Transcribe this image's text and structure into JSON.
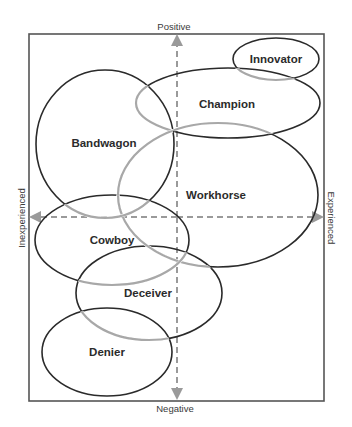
{
  "diagram": {
    "axes": {
      "top_label": "Positive",
      "bottom_label": "Negative",
      "left_label": "Inexperienced",
      "right_label": "Experienced"
    },
    "regions": [
      {
        "id": "innovator",
        "label": "Innovator",
        "cx": 276,
        "cy": 59,
        "rx": 43,
        "ry": 21
      },
      {
        "id": "champion",
        "label": "Champion",
        "cx": 228,
        "cy": 103,
        "rx": 92,
        "ry": 35
      },
      {
        "id": "bandwagon",
        "label": "Bandwagon",
        "cx": 105,
        "cy": 144,
        "rx": 69,
        "ry": 74
      },
      {
        "id": "workhorse",
        "label": "Workhorse",
        "cx": 218,
        "cy": 195,
        "rx": 100,
        "ry": 72
      },
      {
        "id": "cowboy",
        "label": "Cowboy",
        "cx": 112,
        "cy": 240,
        "rx": 77,
        "ry": 45
      },
      {
        "id": "deceiver",
        "label": "Deceiver",
        "cx": 149,
        "cy": 293,
        "rx": 73,
        "ry": 47
      },
      {
        "id": "denier",
        "label": "Denier",
        "cx": 107,
        "cy": 352,
        "rx": 65,
        "ry": 44
      }
    ],
    "colors": {
      "stroke_dark": "#2a2a2a",
      "stroke_light": "#a8a8a8",
      "axis": "#9a9a9a",
      "frame": "#555555"
    }
  }
}
